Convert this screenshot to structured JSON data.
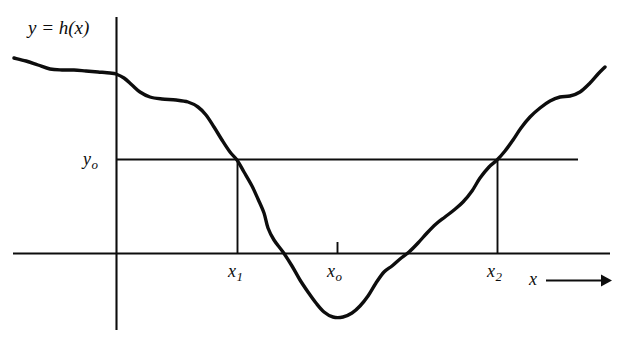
{
  "figure": {
    "caption_visible": false,
    "background_color": "#ffffff",
    "ink_color": "#0d0d0d",
    "curve_label": "y = h(x)",
    "axis_arrow_label": "x",
    "axis_arrow_glyph": "⟶"
  },
  "labels": {
    "y0_base": "y",
    "y0_sub": "o",
    "x1_base": "x",
    "x1_sub": "1",
    "x0_base": "x",
    "x0_sub": "o",
    "x2_base": "x",
    "x2_sub": "2"
  },
  "chart_data": {
    "type": "line",
    "title": "",
    "subtitle": "",
    "xlabel": "x",
    "ylabel": "y",
    "grid": false,
    "legend": null,
    "axes": {
      "x_axis_pixel_y": 253,
      "y_axis_pixel_x": 116,
      "x_axis_extent_px": [
        13,
        610
      ],
      "y_axis_extent_px": [
        17,
        330
      ],
      "x_axis_has_arrow": true,
      "origin_label": ""
    },
    "annotations": [
      {
        "name": "curve-label",
        "text": "y = h(x)",
        "pixel_x": 70,
        "pixel_y": 28
      },
      {
        "name": "level-line-y0",
        "text": "y_o",
        "type": "horizontal-line",
        "pixel_y": 159,
        "from_px": 116,
        "to_px": 578
      },
      {
        "name": "drop-line-x1",
        "text": "x_1",
        "type": "vertical-line",
        "pixel_x": 237,
        "from_px": 159,
        "to_px": 253
      },
      {
        "name": "drop-line-x2",
        "text": "x_2",
        "type": "vertical-line",
        "pixel_x": 497,
        "from_px": 159,
        "to_px": 253
      },
      {
        "name": "tick-x0",
        "text": "x_o",
        "type": "tick",
        "pixel_x": 337,
        "from_px": 243,
        "to_px": 253
      }
    ],
    "series": [
      {
        "name": "h(x)",
        "stroke_width": 3.4,
        "color": "#0d0d0d",
        "points_px": [
          [
            14,
            58
          ],
          [
            26,
            61
          ],
          [
            38,
            65
          ],
          [
            50,
            69
          ],
          [
            62,
            70
          ],
          [
            74,
            70
          ],
          [
            86,
            71
          ],
          [
            98,
            72
          ],
          [
            110,
            73
          ],
          [
            116,
            74
          ],
          [
            124,
            78
          ],
          [
            132,
            85
          ],
          [
            140,
            92
          ],
          [
            150,
            97
          ],
          [
            162,
            99
          ],
          [
            176,
            100
          ],
          [
            188,
            102
          ],
          [
            198,
            107
          ],
          [
            206,
            115
          ],
          [
            214,
            127
          ],
          [
            222,
            140
          ],
          [
            230,
            152
          ],
          [
            237,
            160
          ],
          [
            244,
            172
          ],
          [
            252,
            186
          ],
          [
            258,
            199
          ],
          [
            264,
            213
          ],
          [
            268,
            228
          ],
          [
            274,
            240
          ],
          [
            283,
            252
          ],
          [
            292,
            266
          ],
          [
            300,
            280
          ],
          [
            308,
            292
          ],
          [
            316,
            303
          ],
          [
            324,
            312
          ],
          [
            333,
            317
          ],
          [
            343,
            317
          ],
          [
            352,
            313
          ],
          [
            360,
            306
          ],
          [
            368,
            296
          ],
          [
            376,
            283
          ],
          [
            384,
            272
          ],
          [
            392,
            266
          ],
          [
            400,
            259
          ],
          [
            409,
            252
          ],
          [
            418,
            243
          ],
          [
            427,
            233
          ],
          [
            436,
            224
          ],
          [
            445,
            217
          ],
          [
            454,
            210
          ],
          [
            463,
            202
          ],
          [
            472,
            191
          ],
          [
            480,
            178
          ],
          [
            489,
            167
          ],
          [
            497,
            160
          ],
          [
            505,
            151
          ],
          [
            513,
            140
          ],
          [
            521,
            128
          ],
          [
            530,
            117
          ],
          [
            540,
            108
          ],
          [
            550,
            101
          ],
          [
            560,
            97
          ],
          [
            570,
            96
          ],
          [
            580,
            92
          ],
          [
            590,
            83
          ],
          [
            598,
            74
          ],
          [
            605,
            67
          ]
        ],
        "key_features": [
          {
            "label": "start",
            "px": [
              14,
              58
            ]
          },
          {
            "label": "crosses y-axis",
            "px": [
              116,
              74
            ]
          },
          {
            "label": "upper shelf",
            "px": [
              168,
              99
            ]
          },
          {
            "label": "crosses y_o descending at x_1",
            "px": [
              237,
              160
            ]
          },
          {
            "label": "crosses x-axis descending",
            "px": [
              283,
              252
            ]
          },
          {
            "label": "minimum near x_o",
            "px": [
              333,
              317
            ]
          },
          {
            "label": "crosses x-axis ascending",
            "px": [
              409,
              252
            ]
          },
          {
            "label": "crosses y_o ascending at x_2",
            "px": [
              497,
              160
            ]
          },
          {
            "label": "upper right shelf",
            "px": [
              566,
              96
            ]
          },
          {
            "label": "end",
            "px": [
              605,
              67
            ]
          }
        ]
      }
    ]
  }
}
